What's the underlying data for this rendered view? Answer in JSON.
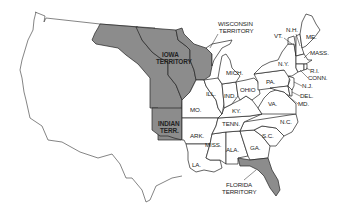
{
  "map": {
    "title": "United States territories map",
    "colors": {
      "territory_fill": "#8c8c8c",
      "state_fill": "#ffffff",
      "border": "#222222",
      "background": "#ffffff"
    },
    "labels": {
      "wisconsin_territory": [
        "WISCONSIN",
        "TERRITORY"
      ],
      "iowa_territory": [
        "IOWA",
        "TERRITORY"
      ],
      "indian_territory": [
        "INDIAN",
        "TERR."
      ],
      "florida_territory": [
        "FLORIDA",
        "TERRITORY"
      ],
      "mich": "MICH.",
      "ill": "ILL.",
      "ind": "IND.",
      "ohio": "OHIO",
      "mo": "MO.",
      "ky": "KY.",
      "tenn": "TENN.",
      "ark": "ARK.",
      "la": "LA.",
      "miss": "MISS.",
      "ala": "ALA.",
      "ga": "GA.",
      "sc": "S.C.",
      "nc": "N.C.",
      "va": "VA.",
      "pa": "PA.",
      "ny": "N.Y.",
      "vt": "VT.",
      "nh": "N.H.",
      "me": "ME.",
      "mass": "MASS.",
      "ri": "R.I.",
      "conn": "CONN.",
      "nj": "N.J.",
      "del": "DEL.",
      "md": "MD."
    }
  }
}
